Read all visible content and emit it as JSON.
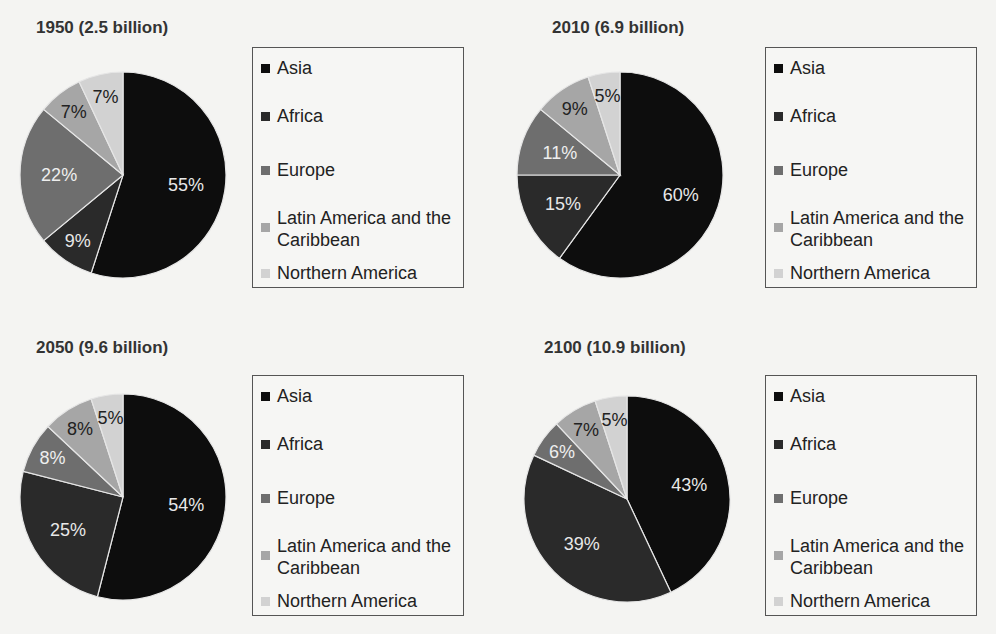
{
  "legend": {
    "items": [
      {
        "label": "Asia",
        "color": "#0d0d0d"
      },
      {
        "label": "Africa",
        "color": "#2a2a2a"
      },
      {
        "label": "Europe",
        "color": "#6e6e6e"
      },
      {
        "label": "Latin America and the Caribbean",
        "color": "#a6a6a6"
      },
      {
        "label": "Northern America",
        "color": "#d2d2d2"
      }
    ]
  },
  "panels": [
    {
      "title": "1950 (2.5 billion)"
    },
    {
      "title": "2010 (6.9 billion)"
    },
    {
      "title": "2050 (9.6 billion)"
    },
    {
      "title": "2100 (10.9 billion)"
    }
  ],
  "chart_data": [
    {
      "type": "pie",
      "title": "1950 (2.5 billion)",
      "categories": [
        "Asia",
        "Africa",
        "Europe",
        "Latin America and the Caribbean",
        "Northern America"
      ],
      "values": [
        55,
        9,
        22,
        7,
        7
      ],
      "labels": [
        "55%",
        "9%",
        "22%",
        "7%",
        "7%"
      ],
      "legend_position": "right"
    },
    {
      "type": "pie",
      "title": "2010 (6.9 billion)",
      "categories": [
        "Asia",
        "Africa",
        "Europe",
        "Latin America and the Caribbean",
        "Northern America"
      ],
      "values": [
        60,
        15,
        11,
        9,
        5
      ],
      "labels": [
        "60%",
        "15%",
        "11%",
        "9%",
        "5%"
      ],
      "legend_position": "right"
    },
    {
      "type": "pie",
      "title": "2050 (9.6 billion)",
      "categories": [
        "Asia",
        "Africa",
        "Europe",
        "Latin America and the Caribbean",
        "Northern America"
      ],
      "values": [
        54,
        25,
        8,
        8,
        5
      ],
      "labels": [
        "54%",
        "25%",
        "8%",
        "8%",
        "5%"
      ],
      "legend_position": "right"
    },
    {
      "type": "pie",
      "title": "2100 (10.9 billion)",
      "categories": [
        "Asia",
        "Africa",
        "Europe",
        "Latin America and the Caribbean",
        "Northern America"
      ],
      "values": [
        43,
        39,
        6,
        7,
        5
      ],
      "labels": [
        "43%",
        "39%",
        "6%",
        "7%",
        "5%"
      ],
      "legend_position": "right"
    }
  ]
}
